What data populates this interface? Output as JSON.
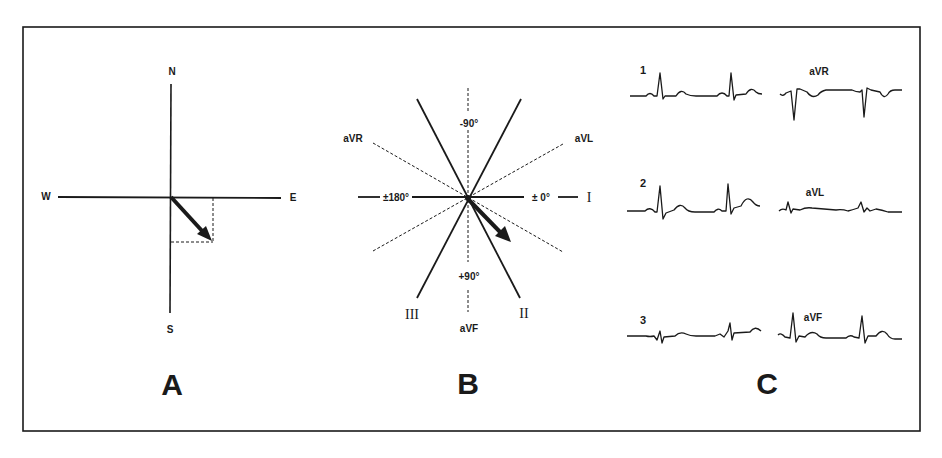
{
  "figure": {
    "panels": [
      {
        "id": "A",
        "title": "A",
        "compass": {
          "north": "N",
          "south": "S",
          "west": "W",
          "east": "E"
        }
      },
      {
        "id": "B",
        "title": "B",
        "axes": {
          "neg90": "-90°",
          "pos90": "+90°",
          "plus_minus_180": "±180°",
          "plus_minus_0": "± 0°"
        },
        "leads": {
          "lead_I": "I",
          "lead_II": "II",
          "lead_III": "III",
          "aVR": "aVR",
          "aVL": "aVL",
          "aVF": "aVF"
        }
      },
      {
        "id": "C",
        "title": "C",
        "traces": [
          {
            "label": "1"
          },
          {
            "label": "aVR"
          },
          {
            "label": "2"
          },
          {
            "label": "aVL"
          },
          {
            "label": "3"
          },
          {
            "label": "aVF"
          }
        ]
      }
    ],
    "colors": {
      "ink": "#1a1a1a",
      "background": "#ffffff"
    }
  }
}
